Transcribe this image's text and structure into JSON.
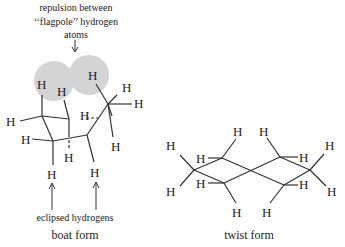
{
  "boat": {
    "annotation_top": [
      "repulsion between",
      "‘‘flagpole’’ hydrogen",
      "atoms"
    ],
    "annotation_bottom": "eclipsed hydrogens",
    "caption": "boat form",
    "atom_label": "H",
    "highlight_color": "#d4d4d4"
  },
  "twist": {
    "caption": "twist form",
    "atom_label": "H"
  }
}
